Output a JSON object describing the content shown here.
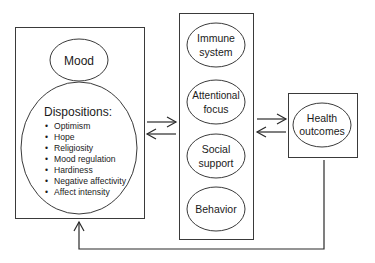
{
  "diagram": {
    "left_box": {
      "mood": {
        "label": "Mood"
      },
      "dispositions": {
        "title": "Dispositions:",
        "items": [
          "Optimism",
          "Hope",
          "Religiosity",
          "Mood regulation",
          "Hardiness",
          "Negative affectivity",
          "Affect intensity"
        ]
      }
    },
    "middle_box": {
      "items": [
        {
          "line1": "Immune",
          "line2": "system"
        },
        {
          "line1": "Attentional",
          "line2": "focus"
        },
        {
          "line1": "Social",
          "line2": "support"
        },
        {
          "line1": "Behavior",
          "line2": ""
        }
      ]
    },
    "right_box": {
      "outcome": {
        "line1": "Health",
        "line2": "outcomes"
      }
    },
    "connections": [
      {
        "from": "left_box",
        "to": "middle_box",
        "type": "bidirectional"
      },
      {
        "from": "middle_box",
        "to": "right_box",
        "type": "bidirectional"
      },
      {
        "from": "right_box",
        "to": "left_box",
        "type": "feedback"
      }
    ],
    "colors": {
      "stroke": "#3a3a3a",
      "text": "#1a1a1a",
      "background": "#ffffff"
    },
    "bullet": "•"
  }
}
